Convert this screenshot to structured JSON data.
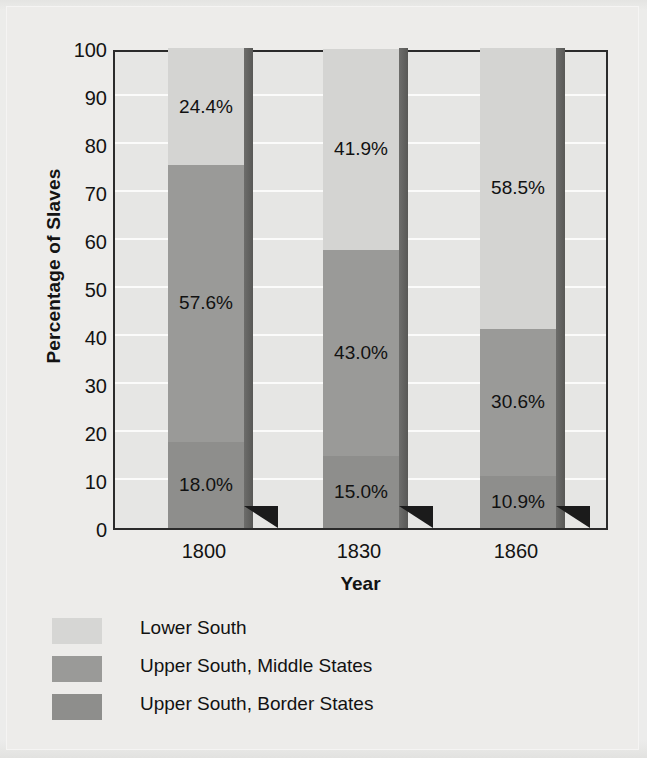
{
  "chart_data": {
    "type": "bar",
    "subtype": "stacked-100-percent",
    "title": "",
    "xlabel": "Year",
    "ylabel": "Percentage of Slaves",
    "categories": [
      "1800",
      "1830",
      "1860"
    ],
    "ylim": [
      0,
      100
    ],
    "yticks": [
      0,
      10,
      20,
      30,
      40,
      50,
      60,
      70,
      80,
      90,
      100
    ],
    "ytick_labels": [
      "0",
      "10",
      "20",
      "30",
      "40",
      "50",
      "60",
      "70",
      "80",
      "90",
      "100"
    ],
    "grid": true,
    "grid_axis": "y",
    "legend_position": "below",
    "series": [
      {
        "name": "Lower South",
        "color": "#d4d4d2",
        "values": [
          24.4,
          41.9,
          58.5
        ],
        "labels": [
          "24.4%",
          "41.9%",
          "58.5%"
        ]
      },
      {
        "name": "Upper South, Middle States",
        "color": "#9a9a98",
        "values": [
          57.6,
          43.0,
          30.6
        ],
        "labels": [
          "57.6%",
          "43.0%",
          "30.6%"
        ]
      },
      {
        "name": "Upper South, Border States",
        "color": "#8e8e8c",
        "values": [
          18.0,
          15.0,
          10.9
        ],
        "labels": [
          "18.0%",
          "15.0%",
          "10.9%"
        ]
      }
    ]
  },
  "axes": {
    "y_title": "Percentage of Slaves",
    "x_title": "Year",
    "y_labels": [
      "100",
      "90",
      "80",
      "70",
      "60",
      "50",
      "40",
      "30",
      "20",
      "10",
      "0"
    ],
    "x_labels": [
      "1800",
      "1830",
      "1860"
    ]
  },
  "bars": [
    {
      "category": "1800",
      "segments": [
        {
          "series": "Lower South",
          "label": "24.4%"
        },
        {
          "series": "Upper South, Middle States",
          "label": "57.6%"
        },
        {
          "series": "Upper South, Border States",
          "label": "18.0%"
        }
      ]
    },
    {
      "category": "1830",
      "segments": [
        {
          "series": "Lower South",
          "label": "41.9%"
        },
        {
          "series": "Upper South, Middle States",
          "label": "43.0%"
        },
        {
          "series": "Upper South, Border States",
          "label": "15.0%"
        }
      ]
    },
    {
      "category": "1860",
      "segments": [
        {
          "series": "Lower South",
          "label": "58.5%"
        },
        {
          "series": "Upper South, Middle States",
          "label": "30.6%"
        },
        {
          "series": "Upper South, Border States",
          "label": "10.9%"
        }
      ]
    }
  ],
  "legend": {
    "items": [
      {
        "label": "Lower South",
        "color": "#d6d6d4"
      },
      {
        "label": "Upper South, Middle States",
        "color": "#9a9a98"
      },
      {
        "label": "Upper South, Border States",
        "color": "#8e8e8c"
      }
    ]
  },
  "colors": {
    "lower_south": "#d4d4d2",
    "upper_south_middle": "#9a9a98",
    "upper_south_border": "#8e8e8c",
    "plot_background": "#e6e6e4",
    "page_background": "#edecea",
    "axis_line": "#2b2b2b",
    "gridline": "#fbfbfa",
    "text": "#131313"
  }
}
